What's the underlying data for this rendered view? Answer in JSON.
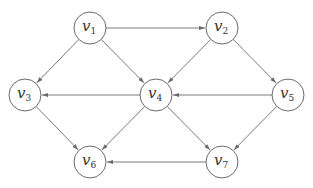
{
  "diagram": {
    "type": "directed-graph",
    "colors": {
      "stroke": "#6a6a6a",
      "edge": "#7a7a7a",
      "text": "#333333",
      "background": "#ffffff"
    },
    "node_radius": 16,
    "nodes": [
      {
        "id": "v1",
        "base": "v",
        "sub": "1",
        "x": 90,
        "y": 28
      },
      {
        "id": "v2",
        "base": "v",
        "sub": "2",
        "x": 222,
        "y": 28
      },
      {
        "id": "v3",
        "base": "v",
        "sub": "3",
        "x": 25,
        "y": 95
      },
      {
        "id": "v4",
        "base": "v",
        "sub": "4",
        "x": 156,
        "y": 95
      },
      {
        "id": "v5",
        "base": "v",
        "sub": "5",
        "x": 288,
        "y": 95
      },
      {
        "id": "v6",
        "base": "v",
        "sub": "6",
        "x": 90,
        "y": 162
      },
      {
        "id": "v7",
        "base": "v",
        "sub": "7",
        "x": 222,
        "y": 162
      }
    ],
    "edges": [
      {
        "from": "v1",
        "to": "v2"
      },
      {
        "from": "v1",
        "to": "v3"
      },
      {
        "from": "v1",
        "to": "v4"
      },
      {
        "from": "v2",
        "to": "v4"
      },
      {
        "from": "v2",
        "to": "v5"
      },
      {
        "from": "v4",
        "to": "v3"
      },
      {
        "from": "v5",
        "to": "v4"
      },
      {
        "from": "v3",
        "to": "v6"
      },
      {
        "from": "v4",
        "to": "v6"
      },
      {
        "from": "v4",
        "to": "v7"
      },
      {
        "from": "v5",
        "to": "v7"
      },
      {
        "from": "v7",
        "to": "v6"
      }
    ]
  }
}
